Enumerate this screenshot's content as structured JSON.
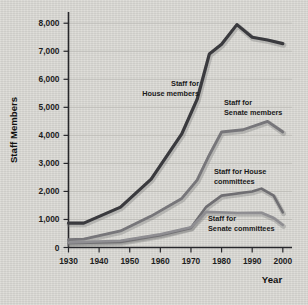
{
  "chart_data": {
    "type": "line",
    "title": "",
    "xlabel": "Year",
    "ylabel": "Staff Members",
    "xlim": [
      1930,
      2003
    ],
    "ylim": [
      0,
      8400
    ],
    "grid": true,
    "legend_position": "inline-annotations",
    "x_ticks": [
      1930,
      1940,
      1950,
      1960,
      1970,
      1980,
      1990,
      2000
    ],
    "x_tick_labels": [
      "1930",
      "1940",
      "1950",
      "1960",
      "1970",
      "1980",
      "1990",
      "2000"
    ],
    "y_ticks": [
      0,
      1000,
      2000,
      3000,
      4000,
      5000,
      6000,
      7000,
      8000
    ],
    "y_tick_labels": [
      "0",
      "1,000",
      "2,000",
      "3,000",
      "4,000",
      "5,000",
      "6,000",
      "7,000",
      "8,000"
    ],
    "series": [
      {
        "name": "Staff for House members",
        "label_lines": [
          "Staff for",
          "House members"
        ],
        "color": "#3a3a3e",
        "x": [
          1930,
          1935,
          1947,
          1957,
          1967,
          1972,
          1976,
          1980,
          1985,
          1990,
          1995,
          2000
        ],
        "values": [
          870,
          870,
          1440,
          2440,
          4050,
          5280,
          6900,
          7250,
          7950,
          7500,
          7400,
          7270
        ]
      },
      {
        "name": "Staff for Senate members",
        "label_lines": [
          "Staff for",
          "Senate members"
        ],
        "color": "#77767a",
        "x": [
          1930,
          1935,
          1947,
          1957,
          1967,
          1972,
          1976,
          1980,
          1987,
          1995,
          2000
        ],
        "values": [
          280,
          300,
          590,
          1120,
          1750,
          2400,
          3300,
          4120,
          4200,
          4500,
          4120
        ]
      },
      {
        "name": "Staff for House committees",
        "label_lines": [
          "Staff for House",
          "committees"
        ],
        "color": "#6f6e72",
        "x": [
          1930,
          1947,
          1960,
          1970,
          1975,
          1980,
          1990,
          1993,
          1997,
          2000
        ],
        "values": [
          150,
          200,
          440,
          700,
          1450,
          1850,
          2000,
          2100,
          1850,
          1250
        ]
      },
      {
        "name": "Staff for Senate committees",
        "label_lines": [
          "Staff for",
          "Senate committees"
        ],
        "color": "#8f8e92",
        "x": [
          1930,
          1947,
          1960,
          1970,
          1975,
          1985,
          1993,
          1997,
          2000
        ],
        "values": [
          180,
          240,
          470,
          720,
          1270,
          1230,
          1240,
          1050,
          800
        ]
      }
    ]
  }
}
